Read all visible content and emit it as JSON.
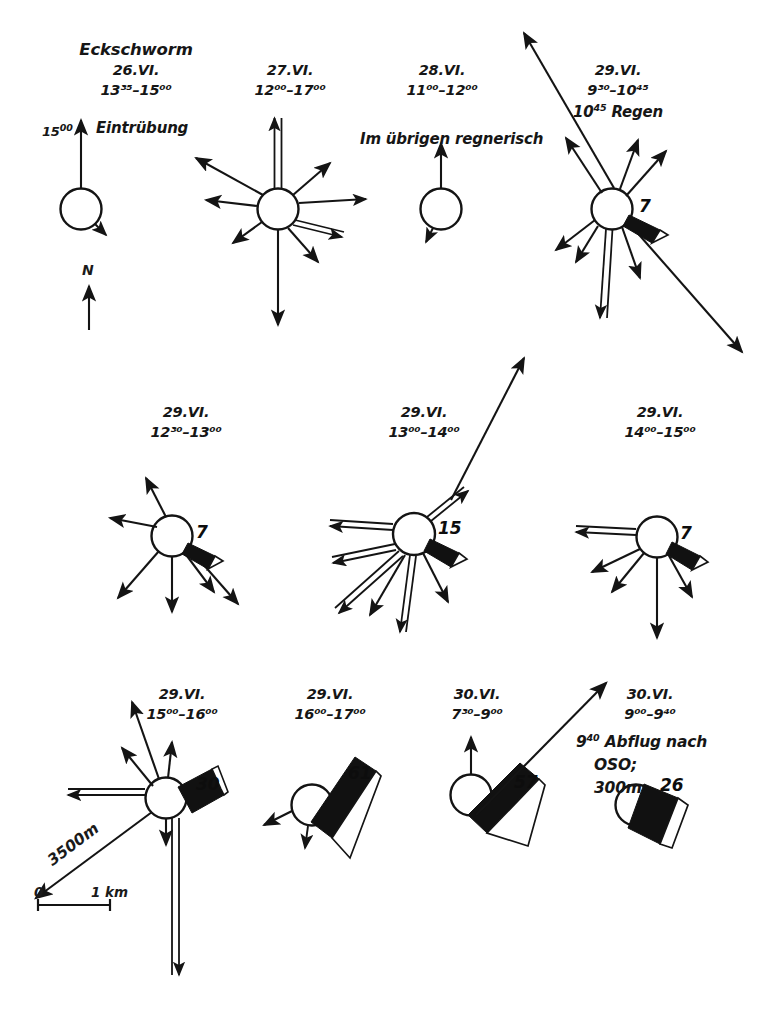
{
  "figure": {
    "type": "bee-dance-direction-diagrams",
    "title": "Eckschworm",
    "north_label": "N",
    "scale": {
      "left_label": "0",
      "right_label": "1 km"
    },
    "distance_annotation": "3500m"
  },
  "notes": {
    "eintruebung": "Eintrübung",
    "eintruebung_time": "15",
    "eintruebung_time_sup": "00",
    "regnerisch": "Im übrigen regnerisch",
    "abflug_line1_time": "9",
    "abflug_line1_time_sup": "40",
    "abflug_line1": "Abflug nach",
    "abflug_line2": "OSO;",
    "abflug_line3": "300m"
  },
  "panels": [
    {
      "id": "p1",
      "date": "26.VI.",
      "time_from": "13",
      "time_from_sup": "35",
      "time_to": "15",
      "time_to_sup": "00",
      "time_text": "13³⁵–15⁰⁰",
      "count": null
    },
    {
      "id": "p2",
      "date": "27.VI.",
      "time_from": "12",
      "time_from_sup": "00",
      "time_to": "17",
      "time_to_sup": "00",
      "time_text": "12⁰⁰–17⁰⁰",
      "count": null
    },
    {
      "id": "p3",
      "date": "28.VI.",
      "time_from": "11",
      "time_from_sup": "00",
      "time_to": "12",
      "time_to_sup": "00",
      "time_text": "11⁰⁰–12⁰⁰",
      "count": null
    },
    {
      "id": "p4",
      "date": "29.VI.",
      "time_from": "9",
      "time_from_sup": "30",
      "time_to": "10",
      "time_to_sup": "45",
      "time_text": "9³⁰–10⁴⁵",
      "extra_time": "10",
      "extra_time_sup": "45",
      "extra_note": "Regen",
      "count": "7"
    },
    {
      "id": "p5",
      "date": "29.VI.",
      "time_from": "12",
      "time_from_sup": "30",
      "time_to": "13",
      "time_to_sup": "00",
      "time_text": "12³⁰–13⁰⁰",
      "count": "7"
    },
    {
      "id": "p6",
      "date": "29.VI.",
      "time_from": "13",
      "time_from_sup": "00",
      "time_to": "14",
      "time_to_sup": "00",
      "time_text": "13⁰⁰–14⁰⁰",
      "count": "15"
    },
    {
      "id": "p7",
      "date": "29.VI.",
      "time_from": "14",
      "time_from_sup": "00",
      "time_to": "15",
      "time_to_sup": "00",
      "time_text": "14⁰⁰–15⁰⁰",
      "count": "7"
    },
    {
      "id": "p8",
      "date": "29.VI.",
      "time_from": "15",
      "time_from_sup": "00",
      "time_to": "16",
      "time_to_sup": "00",
      "time_text": "15⁰⁰–16⁰⁰",
      "count": "30"
    },
    {
      "id": "p9",
      "date": "29.VI.",
      "time_from": "16",
      "time_from_sup": "00",
      "time_to": "17",
      "time_to_sup": "00",
      "time_text": "16⁰⁰–17⁰⁰",
      "count": "61"
    },
    {
      "id": "p10",
      "date": "30.VI.",
      "time_from": "7",
      "time_from_sup": "30",
      "time_to": "9",
      "time_to_sup": "00",
      "time_text": "7³⁰–9⁰⁰",
      "count": "57"
    },
    {
      "id": "p11",
      "date": "30.VI.",
      "time_from": "9",
      "time_from_sup": "00",
      "time_to": "9",
      "time_to_sup": "40",
      "time_text": "9⁰⁰–9⁴⁰",
      "count": "26"
    }
  ],
  "colors": {
    "ink": "#141414",
    "paper": "#ffffff",
    "wedge_fill": "#111111"
  }
}
